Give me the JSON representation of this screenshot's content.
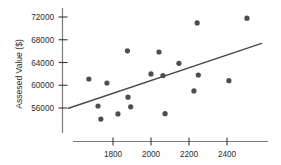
{
  "chart_data": {
    "type": "scatter",
    "title": "",
    "xlabel": "",
    "ylabel": "Assesed Value ($)",
    "grid": false,
    "legend": null,
    "xlim": [
      1620,
      2560
    ],
    "ylim": [
      53400,
      73200
    ],
    "xticks": [
      1800,
      2000,
      2200,
      2400
    ],
    "xtick_labels": [
      "1800",
      "2000",
      "2200",
      "2400"
    ],
    "yticks": [
      56000,
      60000,
      64000,
      68000,
      72000
    ],
    "ytick_labels": [
      "56000",
      "60000",
      "64000",
      "68000",
      "72000"
    ],
    "points": [
      {
        "x": 1673,
        "y": 61100
      },
      {
        "x": 1768,
        "y": 60400
      },
      {
        "x": 1721,
        "y": 56350
      },
      {
        "x": 1736,
        "y": 54050
      },
      {
        "x": 1826,
        "y": 54950
      },
      {
        "x": 1876,
        "y": 66050
      },
      {
        "x": 1879,
        "y": 57900
      },
      {
        "x": 1893,
        "y": 56200
      },
      {
        "x": 2000,
        "y": 62000
      },
      {
        "x": 2042,
        "y": 65850
      },
      {
        "x": 2063,
        "y": 61700
      },
      {
        "x": 2074,
        "y": 55000
      },
      {
        "x": 2147,
        "y": 63850
      },
      {
        "x": 2226,
        "y": 59000
      },
      {
        "x": 2243,
        "y": 70950
      },
      {
        "x": 2249,
        "y": 61800
      },
      {
        "x": 2410,
        "y": 60800
      },
      {
        "x": 2505,
        "y": 71800
      }
    ],
    "trend_line": {
      "x_start": 1566,
      "y_start": 55950,
      "x_end": 2582,
      "y_end": 67350
    },
    "colors": {
      "point": "#4d4d4d",
      "trend": "#4a4a4a",
      "axis": "#7b7b7b",
      "text": "#2b2b2b",
      "background": "#ffffff"
    }
  }
}
